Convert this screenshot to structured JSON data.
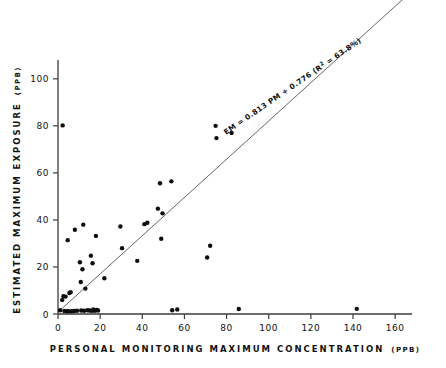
{
  "chart_data": {
    "type": "scatter",
    "title": "",
    "xlabel": "PERSONAL MONITORING MAXIMUM CONCENTRATION",
    "xlabel_unit": "(PPB)",
    "ylabel": "ESTIMATED MAXIMUM EXPOSURE",
    "ylabel_unit": "(PPB)",
    "xlim": [
      0,
      168
    ],
    "ylim": [
      0,
      108
    ],
    "xticks": [
      0,
      20,
      40,
      60,
      80,
      100,
      120,
      140,
      160
    ],
    "xticklabels": [
      "0",
      "20",
      "40",
      "60",
      "80",
      "100",
      "120",
      "140",
      "160"
    ],
    "yticks": [
      0,
      20,
      40,
      60,
      80,
      100
    ],
    "yticklabels": [
      "0",
      "20",
      "40",
      "60",
      "80",
      "100"
    ],
    "grid": false,
    "legend": "none",
    "annotation": {
      "text_before_sup": "EM = 0.813 PM + 0.776 (R",
      "superscript": "2",
      "text_after_sup": " = 63.8%)",
      "full_text": "EM = 0.813 PM + 0.776 (R2 = 63.8%)",
      "rotation_deg": -34.5,
      "x_data": 112,
      "y_data": 96
    },
    "fit": {
      "slope": 0.813,
      "intercept": 0.776,
      "r_squared_percent": 63.8,
      "x_start": 0,
      "x_end": 164
    },
    "points": [
      {
        "x": 1.0,
        "y": 1.6
      },
      {
        "x": 2.0,
        "y": 6.0
      },
      {
        "x": 2.2,
        "y": 80.2
      },
      {
        "x": 2.6,
        "y": 7.6
      },
      {
        "x": 3.0,
        "y": 1.3
      },
      {
        "x": 3.6,
        "y": 7.4
      },
      {
        "x": 4.2,
        "y": 1.2
      },
      {
        "x": 4.6,
        "y": 31.4
      },
      {
        "x": 5.0,
        "y": 1.2
      },
      {
        "x": 5.4,
        "y": 8.9
      },
      {
        "x": 6.0,
        "y": 9.3
      },
      {
        "x": 6.4,
        "y": 1.2
      },
      {
        "x": 7.6,
        "y": 1.3
      },
      {
        "x": 8.0,
        "y": 35.8
      },
      {
        "x": 9.0,
        "y": 1.4
      },
      {
        "x": 10.4,
        "y": 22.0
      },
      {
        "x": 10.8,
        "y": 13.6
      },
      {
        "x": 11.0,
        "y": 1.5
      },
      {
        "x": 11.6,
        "y": 19.0
      },
      {
        "x": 12.0,
        "y": 38.0
      },
      {
        "x": 12.4,
        "y": 1.4
      },
      {
        "x": 13.0,
        "y": 10.8
      },
      {
        "x": 14.0,
        "y": 1.6
      },
      {
        "x": 15.0,
        "y": 1.5
      },
      {
        "x": 15.6,
        "y": 24.8
      },
      {
        "x": 16.0,
        "y": 1.4
      },
      {
        "x": 16.4,
        "y": 21.6
      },
      {
        "x": 16.8,
        "y": 1.9
      },
      {
        "x": 17.4,
        "y": 1.4
      },
      {
        "x": 18.0,
        "y": 33.2
      },
      {
        "x": 18.4,
        "y": 1.7
      },
      {
        "x": 19.0,
        "y": 1.5
      },
      {
        "x": 22.0,
        "y": 15.2
      },
      {
        "x": 29.6,
        "y": 37.2
      },
      {
        "x": 30.4,
        "y": 28.0
      },
      {
        "x": 37.6,
        "y": 22.6
      },
      {
        "x": 41.0,
        "y": 38.2
      },
      {
        "x": 42.4,
        "y": 38.8
      },
      {
        "x": 47.4,
        "y": 44.8
      },
      {
        "x": 48.4,
        "y": 55.6
      },
      {
        "x": 49.0,
        "y": 32.0
      },
      {
        "x": 49.6,
        "y": 42.8
      },
      {
        "x": 53.8,
        "y": 56.4
      },
      {
        "x": 54.2,
        "y": 1.6
      },
      {
        "x": 56.6,
        "y": 1.9
      },
      {
        "x": 70.8,
        "y": 24.0
      },
      {
        "x": 72.2,
        "y": 29.0
      },
      {
        "x": 74.8,
        "y": 80.0
      },
      {
        "x": 75.2,
        "y": 74.8
      },
      {
        "x": 82.4,
        "y": 77.0
      },
      {
        "x": 85.8,
        "y": 2.1
      },
      {
        "x": 141.8,
        "y": 2.2
      }
    ]
  },
  "colors": {
    "point": "#0d0d0d",
    "axis": "#3b3b3b",
    "fit_line": "#555555",
    "background": "#ffffff",
    "text": "#111111"
  }
}
